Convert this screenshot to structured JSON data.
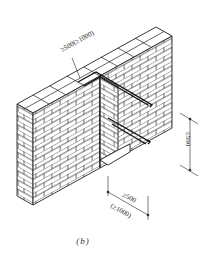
{
  "figure": {
    "caption": "(b)",
    "colors": {
      "line": "#222222",
      "background": "#ffffff"
    }
  },
  "dimensions": {
    "bar_length_top": "≥500(≥1000)",
    "bar_spacing_vertical": "≤500",
    "embed_length_a": "≥500",
    "embed_length_b": "(≥1000)"
  }
}
